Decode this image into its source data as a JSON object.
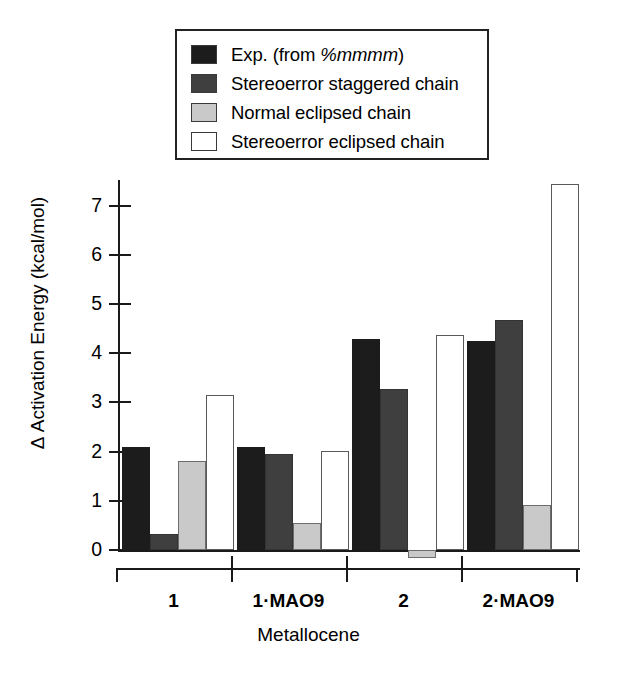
{
  "chart_data": {
    "type": "bar",
    "title": "",
    "xlabel": "Metallocene",
    "ylabel": "Δ Activation Energy (kcal/mol)",
    "categories": [
      "1",
      "1·MAO9",
      "2",
      "2·MAO9"
    ],
    "series": [
      {
        "name": "Exp. (from %mmmm)",
        "color": "#1c1c1c",
        "values": [
          2.1,
          2.1,
          4.28,
          4.25
        ]
      },
      {
        "name": "Stereoerror staggered chain",
        "color": "#3f3f3f",
        "values": [
          0.33,
          1.95,
          3.28,
          4.68
        ]
      },
      {
        "name": "Normal eclipsed chain",
        "color": "#c9c9c9",
        "values": [
          1.8,
          0.55,
          -0.17,
          0.92
        ]
      },
      {
        "name": "Stereoerror eclipsed chain",
        "color": "#ffffff",
        "values": [
          3.15,
          2.02,
          4.36,
          7.43
        ]
      }
    ],
    "yticks": [
      0,
      1,
      2,
      3,
      4,
      5,
      6,
      7
    ],
    "ylim": [
      -0.4,
      7.6
    ],
    "grid": false,
    "legend_position": "top-center"
  },
  "legend": {
    "items": [
      {
        "label_plain": "Exp. (from ",
        "label_italic": "%mmmm",
        "label_tail": ")",
        "swatch": "#1c1c1c"
      },
      {
        "label_plain": "Stereoerror staggered chain",
        "label_italic": "",
        "label_tail": "",
        "swatch": "#3f3f3f"
      },
      {
        "label_plain": "Normal eclipsed chain",
        "label_italic": "",
        "label_tail": "",
        "swatch": "#c9c9c9"
      },
      {
        "label_plain": "Stereoerror eclipsed chain",
        "label_italic": "",
        "label_tail": "",
        "swatch": "#ffffff"
      }
    ]
  },
  "axes": {
    "y_title": "Δ Activation Energy (kcal/mol)",
    "x_title": "Metallocene",
    "y_tick_labels": [
      "7",
      "6",
      "5",
      "4",
      "3",
      "2",
      "1",
      "0"
    ],
    "x_tick_labels": [
      "1",
      "1·MAO9",
      "2",
      "2·MAO9"
    ]
  }
}
